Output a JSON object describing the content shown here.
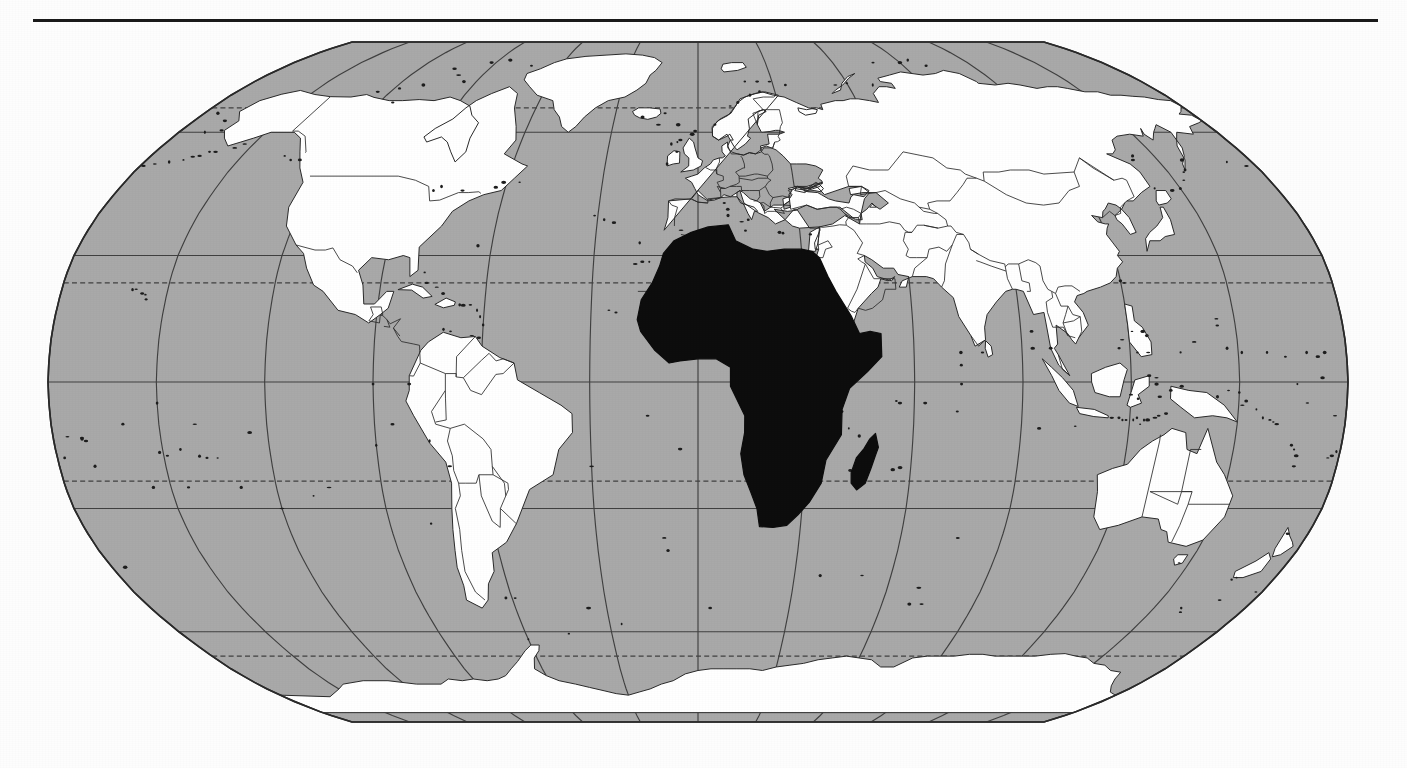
{
  "figure": {
    "kind": "world-map",
    "projection": "Robinson",
    "title": "",
    "caption": "",
    "has_top_rule": true,
    "rule": {
      "x": 33,
      "y": 19,
      "width": 1345,
      "height": 3,
      "color": "#1a1a1a"
    }
  },
  "colors": {
    "page_background": "#fdfdfd",
    "ocean": "#a9a9a9",
    "land": "#ffffff",
    "highlight": "#0d0d0d",
    "outline": "#2a2a2a",
    "graticule": "#404040",
    "rule": "#1a1a1a"
  },
  "map": {
    "frame": {
      "left": 48,
      "top": 12,
      "right": 1348,
      "bottom": 692
    },
    "center_longitude": 0,
    "highlighted_region": "Africa",
    "highlighted_includes": [
      "Africa mainland",
      "Madagascar"
    ],
    "land_fill_label": "white",
    "ocean_fill_label": "gray",
    "country_borders_visible": true
  },
  "graticule": {
    "meridian_interval_degrees": 30,
    "meridians": [
      -180,
      -150,
      -120,
      -90,
      -60,
      -30,
      0,
      30,
      60,
      90,
      120,
      150,
      180
    ],
    "parallels": [
      -66.5,
      -60,
      -30,
      -23.5,
      0,
      23.5,
      30,
      60,
      66.5
    ],
    "dashed_parallels": [
      -66.5,
      -23.5,
      23.5,
      66.5
    ],
    "solid_parallels": [
      -60,
      -30,
      0,
      30,
      60
    ],
    "equator_degrees": 0,
    "tropic_of_cancer_degrees": 23.5,
    "tropic_of_capricorn_degrees": -23.5,
    "arctic_circle_degrees": 66.5,
    "antarctic_circle_degrees": -66.5
  },
  "regions": {
    "highlighted": [
      {
        "name": "Africa",
        "fill": "highlight"
      },
      {
        "name": "Madagascar",
        "fill": "highlight"
      }
    ],
    "plain": [
      {
        "name": "North America",
        "fill": "land"
      },
      {
        "name": "South America",
        "fill": "land"
      },
      {
        "name": "Europe",
        "fill": "land"
      },
      {
        "name": "Asia",
        "fill": "land"
      },
      {
        "name": "Australia",
        "fill": "land"
      },
      {
        "name": "Antarctica",
        "fill": "land"
      },
      {
        "name": "Greenland",
        "fill": "land"
      },
      {
        "name": "New Zealand",
        "fill": "land"
      },
      {
        "name": "Japan",
        "fill": "land"
      },
      {
        "name": "Indonesia",
        "fill": "land"
      },
      {
        "name": "British Isles",
        "fill": "land"
      },
      {
        "name": "Iceland",
        "fill": "land"
      }
    ]
  },
  "labels": {
    "text_present": false,
    "visible_text": []
  }
}
